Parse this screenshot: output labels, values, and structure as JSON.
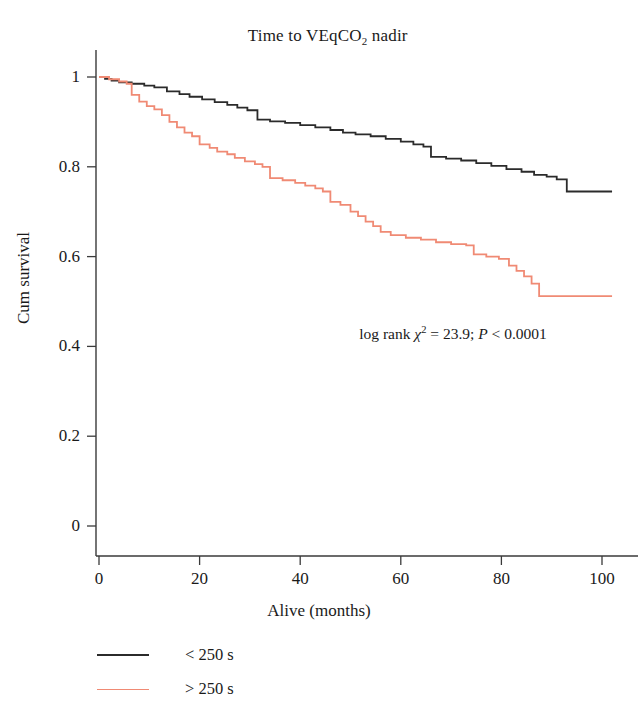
{
  "chart_data": {
    "type": "line",
    "subtype": "kaplan-meier-survival",
    "title": "Time to VEqCO2 nadir",
    "title_parts": {
      "prefix": "Time to VEqCO",
      "subscript": "2",
      "suffix": " nadir"
    },
    "xlabel": "Alive (months)",
    "ylabel": "Cum survival",
    "xlim": [
      0,
      104
    ],
    "ylim": [
      0,
      1.06
    ],
    "xticks": [
      0,
      20,
      40,
      60,
      80,
      100
    ],
    "xtick_labels": [
      "0",
      "20",
      "40",
      "60",
      "80",
      "100"
    ],
    "yticks": [
      0,
      0.2,
      0.4,
      0.6,
      0.8,
      1
    ],
    "ytick_labels": [
      "0",
      "0.2",
      "0.4",
      "0.6",
      "0.8",
      "1"
    ],
    "grid": false,
    "legend_position": "below-left",
    "annotation": {
      "text": "log rank χ² = 23.9; P < 0.0001",
      "prefix": "log rank ",
      "chi": "χ",
      "sup": "2",
      "mid": " = 23.9; ",
      "p": "P",
      "tail": " < 0.0001",
      "x": 48,
      "y": 0.44
    },
    "series": [
      {
        "name": "< 250 s",
        "color": "#2b2b2b",
        "line_width": 1.8,
        "final_survival": 0.745,
        "points": [
          [
            0,
            1.0
          ],
          [
            1.2,
            0.996
          ],
          [
            2.5,
            0.992
          ],
          [
            4.0,
            0.988
          ],
          [
            6.5,
            0.985
          ],
          [
            9.0,
            0.981
          ],
          [
            11.0,
            0.977
          ],
          [
            13.5,
            0.968
          ],
          [
            16.0,
            0.962
          ],
          [
            18.0,
            0.956
          ],
          [
            20.5,
            0.95
          ],
          [
            23.0,
            0.944
          ],
          [
            25.5,
            0.938
          ],
          [
            27.5,
            0.932
          ],
          [
            29.5,
            0.926
          ],
          [
            31.5,
            0.905
          ],
          [
            34.0,
            0.901
          ],
          [
            37.0,
            0.898
          ],
          [
            40.0,
            0.893
          ],
          [
            43.0,
            0.888
          ],
          [
            46.0,
            0.882
          ],
          [
            48.5,
            0.876
          ],
          [
            51.0,
            0.872
          ],
          [
            54.0,
            0.868
          ],
          [
            57.0,
            0.862
          ],
          [
            60.0,
            0.856
          ],
          [
            62.5,
            0.85
          ],
          [
            64.5,
            0.845
          ],
          [
            66.0,
            0.822
          ],
          [
            69.0,
            0.818
          ],
          [
            72.0,
            0.814
          ],
          [
            75.0,
            0.808
          ],
          [
            78.0,
            0.802
          ],
          [
            81.0,
            0.795
          ],
          [
            84.0,
            0.789
          ],
          [
            86.5,
            0.782
          ],
          [
            89.0,
            0.778
          ],
          [
            91.0,
            0.772
          ],
          [
            93.0,
            0.745
          ],
          [
            102.0,
            0.745
          ]
        ]
      },
      {
        "name": "> 250 s",
        "color": "#f08a74",
        "line_width": 1.8,
        "final_survival": 0.512,
        "points": [
          [
            0,
            1.0
          ],
          [
            2.0,
            0.995
          ],
          [
            4.0,
            0.99
          ],
          [
            5.5,
            0.985
          ],
          [
            6.5,
            0.96
          ],
          [
            8.0,
            0.945
          ],
          [
            9.5,
            0.935
          ],
          [
            11.0,
            0.928
          ],
          [
            12.5,
            0.915
          ],
          [
            14.0,
            0.9
          ],
          [
            15.5,
            0.888
          ],
          [
            17.0,
            0.876
          ],
          [
            18.5,
            0.868
          ],
          [
            20.0,
            0.85
          ],
          [
            22.0,
            0.842
          ],
          [
            23.5,
            0.834
          ],
          [
            25.5,
            0.828
          ],
          [
            27.0,
            0.82
          ],
          [
            29.0,
            0.812
          ],
          [
            31.0,
            0.806
          ],
          [
            32.5,
            0.8
          ],
          [
            34.0,
            0.775
          ],
          [
            36.5,
            0.77
          ],
          [
            39.0,
            0.764
          ],
          [
            41.0,
            0.758
          ],
          [
            43.0,
            0.752
          ],
          [
            44.5,
            0.745
          ],
          [
            46.0,
            0.722
          ],
          [
            48.0,
            0.715
          ],
          [
            50.0,
            0.7
          ],
          [
            51.5,
            0.69
          ],
          [
            53.0,
            0.678
          ],
          [
            54.5,
            0.668
          ],
          [
            56.0,
            0.655
          ],
          [
            58.0,
            0.648
          ],
          [
            61.0,
            0.642
          ],
          [
            64.0,
            0.638
          ],
          [
            67.0,
            0.632
          ],
          [
            70.0,
            0.628
          ],
          [
            73.0,
            0.625
          ],
          [
            74.5,
            0.605
          ],
          [
            77.0,
            0.6
          ],
          [
            79.5,
            0.595
          ],
          [
            81.5,
            0.58
          ],
          [
            83.0,
            0.568
          ],
          [
            84.5,
            0.556
          ],
          [
            86.0,
            0.54
          ],
          [
            87.5,
            0.512
          ],
          [
            102.0,
            0.512
          ]
        ]
      }
    ]
  },
  "legend": {
    "items": [
      {
        "label": "< 250 s",
        "color": "#2b2b2b"
      },
      {
        "label": "> 250 s",
        "color": "#f08a74"
      }
    ]
  }
}
